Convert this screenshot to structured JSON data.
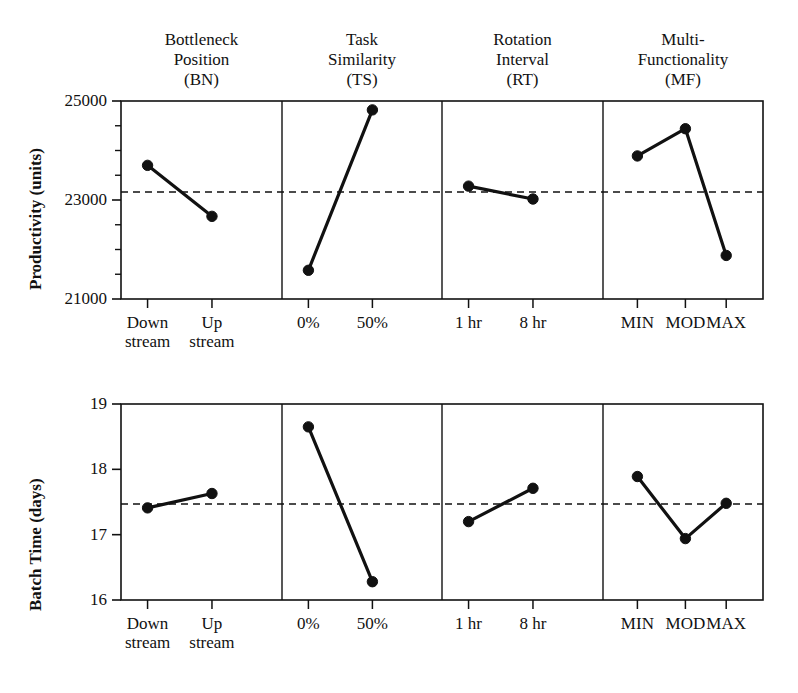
{
  "figure": {
    "background": "#ffffff",
    "ink_color": "#111111"
  },
  "chart_data": [
    {
      "type": "line",
      "name": "productivity-main-effects",
      "title": "",
      "xlabel": "",
      "ylabel": "Productivity (units)",
      "ylim": [
        21000,
        25000
      ],
      "ytick_labels": [
        "25000",
        "23000",
        "21000"
      ],
      "ytick_values": [
        25000,
        23000,
        21000
      ],
      "yminor_step": 500,
      "grid": false,
      "legend": "none",
      "reference_line": {
        "value": 23160,
        "style": "dashed",
        "label": "overall mean"
      },
      "panels": [
        {
          "factor": "Bottleneck Position (BN)",
          "factor_lines": [
            "Bottleneck",
            "Position",
            "(BN)"
          ],
          "categories": [
            "Down stream",
            "Up stream"
          ],
          "category_lines": [
            [
              "Down",
              "stream"
            ],
            [
              "Up",
              "stream"
            ]
          ],
          "values": [
            23700,
            22670
          ]
        },
        {
          "factor": "Task Similarity (TS)",
          "factor_lines": [
            "Task",
            "Similarity",
            "(TS)"
          ],
          "categories": [
            "0%",
            "50%"
          ],
          "category_lines": [
            [
              "0%"
            ],
            [
              "50%"
            ]
          ],
          "values": [
            21580,
            24820
          ]
        },
        {
          "factor": "Rotation Interval (RT)",
          "factor_lines": [
            "Rotation",
            "Interval",
            "(RT)"
          ],
          "categories": [
            "1 hr",
            "8 hr"
          ],
          "category_lines": [
            [
              "1 hr"
            ],
            [
              "8 hr"
            ]
          ],
          "values": [
            23280,
            23020
          ]
        },
        {
          "factor": "Multi-Functionality (MF)",
          "factor_lines": [
            "Multi-",
            "Functionality",
            "(MF)"
          ],
          "categories": [
            "MIN",
            "MOD",
            "MAX"
          ],
          "category_lines": [
            [
              "MIN"
            ],
            [
              "MOD"
            ],
            [
              "MAX"
            ]
          ],
          "values": [
            23890,
            24440,
            21880
          ]
        }
      ]
    },
    {
      "type": "line",
      "name": "batch-time-main-effects",
      "title": "",
      "xlabel": "",
      "ylabel": "Batch Time (days)",
      "ylim": [
        16,
        19
      ],
      "ytick_labels": [
        "19",
        "18",
        "17",
        "16"
      ],
      "ytick_values": [
        19,
        18,
        17,
        16
      ],
      "grid": false,
      "legend": "none",
      "reference_line": {
        "value": 17.47,
        "style": "dashed",
        "label": "overall mean"
      },
      "panels": [
        {
          "factor": "Bottleneck Position (BN)",
          "categories": [
            "Down stream",
            "Up stream"
          ],
          "category_lines": [
            [
              "Down",
              "stream"
            ],
            [
              "Up",
              "stream"
            ]
          ],
          "values": [
            17.41,
            17.63
          ]
        },
        {
          "factor": "Task Similarity (TS)",
          "categories": [
            "0%",
            "50%"
          ],
          "category_lines": [
            [
              "0%"
            ],
            [
              "50%"
            ]
          ],
          "values": [
            18.65,
            16.28
          ]
        },
        {
          "factor": "Rotation Interval (RT)",
          "categories": [
            "1 hr",
            "8 hr"
          ],
          "category_lines": [
            [
              "1 hr"
            ],
            [
              "8 hr"
            ]
          ],
          "values": [
            17.2,
            17.71
          ]
        },
        {
          "factor": "Multi-Functionality (MF)",
          "categories": [
            "MIN",
            "MOD",
            "MAX"
          ],
          "category_lines": [
            [
              "MIN"
            ],
            [
              "MOD"
            ],
            [
              "MAX"
            ]
          ],
          "values": [
            17.89,
            16.94,
            17.48
          ]
        }
      ]
    }
  ]
}
